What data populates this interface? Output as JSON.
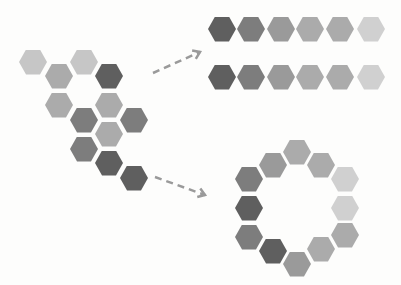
{
  "colors": {
    "c1": "#c6c6c6",
    "c2": "#ababab",
    "c3": "#9a9a9a",
    "c4": "#7d7d7d",
    "c5": "#5f5f5f",
    "c6": "#d0d0d0"
  },
  "cluster": [
    {
      "x": 33,
      "y": 62,
      "c": "c1"
    },
    {
      "x": 84,
      "y": 62,
      "c": "c1"
    },
    {
      "x": 59,
      "y": 76,
      "c": "c2"
    },
    {
      "x": 109,
      "y": 76,
      "c": "c5"
    },
    {
      "x": 59,
      "y": 105,
      "c": "c2"
    },
    {
      "x": 109,
      "y": 105,
      "c": "c2"
    },
    {
      "x": 84,
      "y": 120,
      "c": "c4"
    },
    {
      "x": 134,
      "y": 120,
      "c": "c4"
    },
    {
      "x": 109,
      "y": 134,
      "c": "c2"
    },
    {
      "x": 84,
      "y": 149,
      "c": "c4"
    },
    {
      "x": 109,
      "y": 163,
      "c": "c5"
    },
    {
      "x": 134,
      "y": 178,
      "c": "c5"
    }
  ],
  "strips": [
    {
      "y": 29,
      "xs": [
        222,
        251,
        281,
        310,
        340,
        371
      ],
      "cs": [
        "c5",
        "c4",
        "c3",
        "c2",
        "c2",
        "c6"
      ]
    },
    {
      "y": 77,
      "xs": [
        222,
        251,
        281,
        310,
        340,
        371
      ],
      "cs": [
        "c5",
        "c4",
        "c3",
        "c2",
        "c2",
        "c6"
      ]
    }
  ],
  "ring": [
    {
      "x": 297,
      "y": 152,
      "c": "c2"
    },
    {
      "x": 273,
      "y": 165,
      "c": "c3"
    },
    {
      "x": 321,
      "y": 165,
      "c": "c2"
    },
    {
      "x": 249,
      "y": 179,
      "c": "c4"
    },
    {
      "x": 345,
      "y": 179,
      "c": "c6"
    },
    {
      "x": 249,
      "y": 208,
      "c": "c5"
    },
    {
      "x": 345,
      "y": 208,
      "c": "c6"
    },
    {
      "x": 249,
      "y": 237,
      "c": "c4"
    },
    {
      "x": 345,
      "y": 235,
      "c": "c2"
    },
    {
      "x": 273,
      "y": 251,
      "c": "c5"
    },
    {
      "x": 321,
      "y": 249,
      "c": "c2"
    },
    {
      "x": 297,
      "y": 264,
      "c": "c3"
    }
  ],
  "arrows": [
    {
      "x1": 153,
      "y1": 73,
      "x2": 200,
      "y2": 52
    },
    {
      "x1": 155,
      "y1": 177,
      "x2": 205,
      "y2": 195
    }
  ]
}
